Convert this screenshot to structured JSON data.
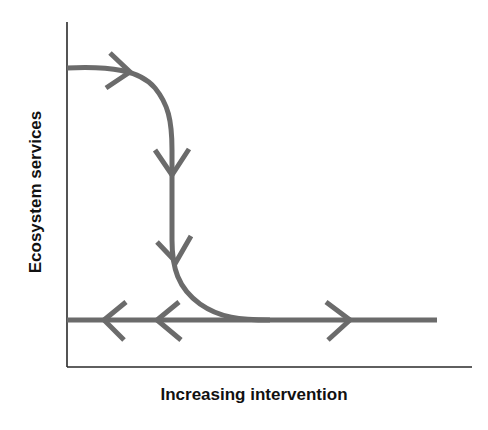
{
  "diagram": {
    "type": "phase-diagram",
    "x_axis_label": "Increasing intervention",
    "y_axis_label": "Ecosystem services",
    "colors": {
      "axis": "#2a2a2a",
      "flow_line": "#6b6b6b",
      "label_text": "#111111",
      "background": "#ffffff"
    },
    "elements": [
      {
        "id": "upper-curve",
        "description": "Curve starting high on y-axis, moving right, bending down and flattening into the lower horizontal line",
        "arrows": [
          "right",
          "down",
          "down"
        ]
      },
      {
        "id": "lower-horizontal-line",
        "description": "Horizontal line near bottom of plot",
        "arrows": [
          "left",
          "left",
          "right"
        ]
      }
    ]
  }
}
